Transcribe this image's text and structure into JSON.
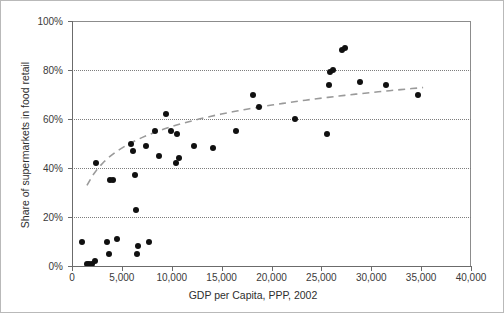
{
  "chart_data": {
    "type": "scatter",
    "title": "",
    "xlabel": "GDP per Capita, PPP, 2002",
    "ylabel": "Share of supermarkets in food retail",
    "xlim": [
      0,
      40000
    ],
    "ylim": [
      0,
      1.0
    ],
    "grid": "horizontal-dotted",
    "legend": "none",
    "x_ticks": [
      0,
      5000,
      10000,
      15000,
      20000,
      25000,
      30000,
      35000,
      40000
    ],
    "x_tick_labels": [
      "0",
      "5,000",
      "10,000",
      "15,000",
      "20,000",
      "25,000",
      "30,000",
      "35,000",
      "40,000"
    ],
    "y_ticks": [
      0,
      0.2,
      0.4,
      0.6,
      0.8,
      1.0
    ],
    "y_tick_labels": [
      "0%",
      "20%",
      "40%",
      "60%",
      "80%",
      "100%"
    ],
    "marker_color": "#101010",
    "trend_color": "#9a9a9a",
    "trend_style": "dashed",
    "trend_description": "Logarithmic best-fit curve rising steeply from ~0% near 1,500 to ~78% at 35,000",
    "points": [
      {
        "x": 1000,
        "y": 0.1
      },
      {
        "x": 1550,
        "y": 0.01
      },
      {
        "x": 1750,
        "y": 0.01
      },
      {
        "x": 2000,
        "y": 0.01
      },
      {
        "x": 2350,
        "y": 0.02
      },
      {
        "x": 2450,
        "y": 0.42
      },
      {
        "x": 3550,
        "y": 0.1
      },
      {
        "x": 3700,
        "y": 0.05
      },
      {
        "x": 3800,
        "y": 0.35
      },
      {
        "x": 4100,
        "y": 0.35
      },
      {
        "x": 4500,
        "y": 0.11
      },
      {
        "x": 5900,
        "y": 0.5
      },
      {
        "x": 6150,
        "y": 0.47
      },
      {
        "x": 6350,
        "y": 0.37
      },
      {
        "x": 6450,
        "y": 0.23
      },
      {
        "x": 6500,
        "y": 0.05
      },
      {
        "x": 6600,
        "y": 0.08
      },
      {
        "x": 7400,
        "y": 0.49
      },
      {
        "x": 7750,
        "y": 0.1
      },
      {
        "x": 8300,
        "y": 0.55
      },
      {
        "x": 8700,
        "y": 0.45
      },
      {
        "x": 9450,
        "y": 0.62
      },
      {
        "x": 9900,
        "y": 0.55
      },
      {
        "x": 10400,
        "y": 0.42
      },
      {
        "x": 10500,
        "y": 0.54
      },
      {
        "x": 10700,
        "y": 0.44
      },
      {
        "x": 12200,
        "y": 0.49
      },
      {
        "x": 14100,
        "y": 0.48
      },
      {
        "x": 16400,
        "y": 0.55
      },
      {
        "x": 18100,
        "y": 0.7
      },
      {
        "x": 18700,
        "y": 0.65
      },
      {
        "x": 22400,
        "y": 0.6
      },
      {
        "x": 25600,
        "y": 0.54
      },
      {
        "x": 25800,
        "y": 0.74
      },
      {
        "x": 25900,
        "y": 0.79
      },
      {
        "x": 26200,
        "y": 0.8
      },
      {
        "x": 27100,
        "y": 0.88
      },
      {
        "x": 27350,
        "y": 0.89
      },
      {
        "x": 28900,
        "y": 0.75
      },
      {
        "x": 31500,
        "y": 0.74
      },
      {
        "x": 34700,
        "y": 0.7
      }
    ]
  }
}
